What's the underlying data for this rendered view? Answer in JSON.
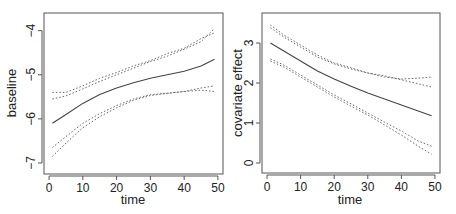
{
  "chart_data": [
    {
      "type": "line",
      "title": "",
      "xlabel": "time",
      "ylabel": "baseline",
      "xlim": [
        -1.5,
        51.5
      ],
      "ylim": [
        -7.25,
        -3.6
      ],
      "xticks": [
        0,
        10,
        20,
        30,
        40,
        50
      ],
      "yticks": [
        -7,
        -6,
        -5,
        -4
      ],
      "ytick_labels": [
        "−7",
        "−6",
        "−5",
        "−4"
      ],
      "grid": false,
      "x": [
        1,
        5,
        10,
        15,
        20,
        25,
        30,
        35,
        40,
        45,
        49
      ],
      "series": [
        {
          "name": "estimate",
          "style": "solid",
          "values": [
            -6.1,
            -5.9,
            -5.65,
            -5.45,
            -5.3,
            -5.18,
            -5.08,
            -5.0,
            -4.92,
            -4.8,
            -4.65
          ]
        },
        {
          "name": "upper band 1",
          "style": "dotted",
          "values": [
            -5.4,
            -5.4,
            -5.25,
            -5.08,
            -4.95,
            -4.8,
            -4.68,
            -4.52,
            -4.4,
            -4.18,
            -4.05
          ]
        },
        {
          "name": "upper band 2",
          "style": "dotted",
          "values": [
            -5.55,
            -5.48,
            -5.32,
            -5.15,
            -5.0,
            -4.85,
            -4.7,
            -4.58,
            -4.42,
            -4.25,
            -3.95
          ]
        },
        {
          "name": "lower band 1",
          "style": "dotted",
          "values": [
            -6.65,
            -6.4,
            -6.1,
            -5.88,
            -5.7,
            -5.55,
            -5.45,
            -5.42,
            -5.38,
            -5.35,
            -5.38
          ]
        },
        {
          "name": "lower band 2",
          "style": "dotted",
          "values": [
            -6.85,
            -6.55,
            -6.2,
            -5.95,
            -5.75,
            -5.58,
            -5.47,
            -5.42,
            -5.38,
            -5.3,
            -5.25
          ]
        }
      ]
    },
    {
      "type": "line",
      "title": "",
      "xlabel": "time",
      "ylabel": "covariate effect",
      "xlim": [
        -1.5,
        51.5
      ],
      "ylim": [
        -0.25,
        3.75
      ],
      "xticks": [
        0,
        10,
        20,
        30,
        40,
        50
      ],
      "yticks": [
        0,
        1,
        2,
        3
      ],
      "ytick_labels": [
        "0",
        "1",
        "2",
        "3"
      ],
      "grid": false,
      "x": [
        1,
        5,
        10,
        15,
        20,
        25,
        30,
        35,
        40,
        45,
        49
      ],
      "series": [
        {
          "name": "estimate",
          "style": "solid",
          "values": [
            3.0,
            2.8,
            2.55,
            2.3,
            2.1,
            1.92,
            1.75,
            1.6,
            1.45,
            1.3,
            1.18
          ]
        },
        {
          "name": "upper band 1",
          "style": "dotted",
          "values": [
            3.45,
            3.2,
            2.95,
            2.7,
            2.5,
            2.38,
            2.25,
            2.15,
            2.1,
            2.12,
            2.15
          ]
        },
        {
          "name": "upper band 2",
          "style": "dotted",
          "values": [
            3.38,
            3.15,
            2.9,
            2.65,
            2.48,
            2.35,
            2.25,
            2.18,
            2.08,
            1.98,
            1.9
          ]
        },
        {
          "name": "lower band 1",
          "style": "dotted",
          "values": [
            2.6,
            2.45,
            2.2,
            1.95,
            1.7,
            1.48,
            1.25,
            1.02,
            0.8,
            0.55,
            0.42
          ]
        },
        {
          "name": "lower band 2",
          "style": "dotted",
          "values": [
            2.55,
            2.4,
            2.15,
            1.9,
            1.65,
            1.42,
            1.2,
            0.95,
            0.7,
            0.42,
            0.22
          ]
        }
      ]
    }
  ],
  "panels": [
    {
      "xlabel": "time",
      "ylabel": "baseline"
    },
    {
      "xlabel": "time",
      "ylabel": "covariate effect"
    }
  ]
}
